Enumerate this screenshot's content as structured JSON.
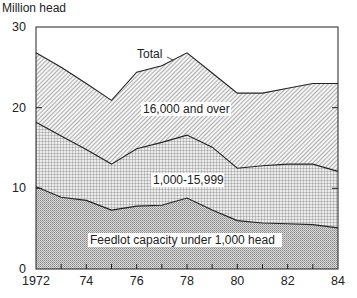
{
  "chart_data": {
    "type": "area",
    "stacked": true,
    "title": "",
    "ylabel": "Million head",
    "xlabel": "",
    "x": [
      1972,
      1973,
      1974,
      1975,
      1976,
      1977,
      1978,
      1979,
      1980,
      1981,
      1982,
      1983,
      1984
    ],
    "xlim": [
      1972,
      1984
    ],
    "ylim": [
      0,
      30
    ],
    "x_tick_labels": [
      "1972",
      "74",
      "76",
      "78",
      "80",
      "82",
      "84"
    ],
    "x_tick_values": [
      1972,
      1974,
      1976,
      1978,
      1980,
      1982,
      1984
    ],
    "y_tick_labels": [
      "0",
      "10",
      "20",
      "30"
    ],
    "y_tick_values": [
      0,
      10,
      20,
      30
    ],
    "grid": false,
    "series": [
      {
        "name": "Feedlot capacity under 1,000 head",
        "pattern": "dots",
        "cumulative_values": [
          10.2,
          8.9,
          8.5,
          7.3,
          7.8,
          7.9,
          8.8,
          7.3,
          6.0,
          5.7,
          5.6,
          5.5,
          5.1
        ]
      },
      {
        "name": "1,000-15,999",
        "pattern": "crosshatch",
        "cumulative_values": [
          18.2,
          16.5,
          14.8,
          13.0,
          14.9,
          15.7,
          16.6,
          15.1,
          12.5,
          12.8,
          13.0,
          13.0,
          12.1
        ]
      },
      {
        "name": "16,000 and over",
        "pattern": "diagonal",
        "cumulative_values": [
          26.8,
          25.0,
          23.0,
          20.9,
          24.4,
          25.2,
          26.8,
          24.3,
          21.8,
          21.8,
          22.4,
          23.0,
          23.0
        ]
      }
    ],
    "annotations": [
      {
        "text": "Total",
        "x": 1976.8,
        "y": 27.3,
        "points_to_series": "16,000 and over"
      },
      {
        "text": "16,000 and over",
        "x": 1976.0,
        "y": 19.5
      },
      {
        "text": "1,000-15,999",
        "x": 1976.0,
        "y": 11.0
      },
      {
        "text": "Feedlot capacity under 1,000 head",
        "x": 1975.6,
        "y": 2.2
      }
    ]
  }
}
